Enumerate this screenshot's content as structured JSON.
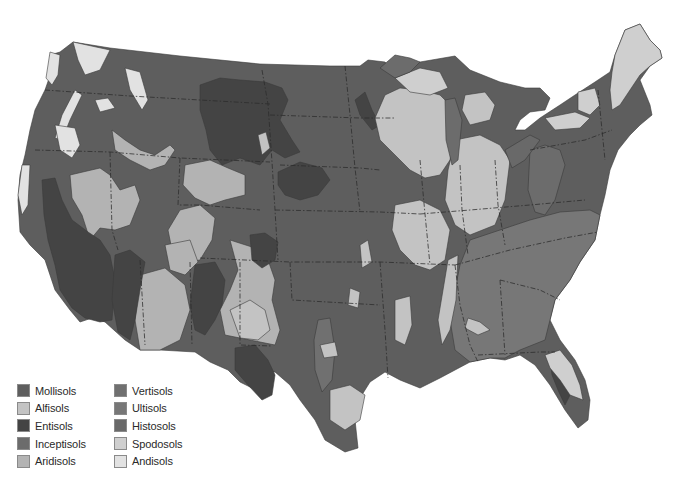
{
  "map": {
    "title": "Soil orders of the contiguous United States",
    "colors": {
      "mollisols": "#5e5e5e",
      "alfisols": "#c3c3c3",
      "entisols": "#444444",
      "inceptisols": "#6c6c6c",
      "aridisols": "#b3b3b3",
      "vertisols": "#707070",
      "ultisols": "#777777",
      "histosols": "#696969",
      "spodosols": "#cfcfcf",
      "andisols": "#e2e2e2"
    }
  },
  "legend": {
    "items": [
      {
        "label": "Mollisols",
        "color": "#5e5e5e"
      },
      {
        "label": "Alfisols",
        "color": "#c3c3c3"
      },
      {
        "label": "Entisols",
        "color": "#444444"
      },
      {
        "label": "Inceptisols",
        "color": "#6c6c6c"
      },
      {
        "label": "Aridisols",
        "color": "#b3b3b3"
      },
      {
        "label": "Vertisols",
        "color": "#707070"
      },
      {
        "label": "Ultisols",
        "color": "#777777"
      },
      {
        "label": "Histosols",
        "color": "#696969"
      },
      {
        "label": "Spodosols",
        "color": "#cfcfcf"
      },
      {
        "label": "Andisols",
        "color": "#e2e2e2"
      }
    ]
  }
}
